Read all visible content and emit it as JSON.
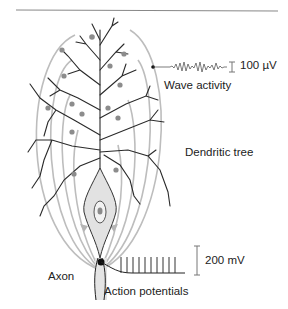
{
  "figure": {
    "type": "neuron-diagram",
    "labels": {
      "wave_scale": "100 µV",
      "wave_activity": "Wave activity",
      "dendritic_tree": "Dendritic tree",
      "ap_scale": "200 mV",
      "axon": "Axon",
      "action_potentials": "Action potentials"
    },
    "colors": {
      "dendrite": "#2a2a2a",
      "field_lines": "#b8b8b8",
      "soma_fill": "#e2e2e2",
      "synapse_dots": "#8a8a8a",
      "rule": "#888888"
    },
    "spike_count": 10
  }
}
